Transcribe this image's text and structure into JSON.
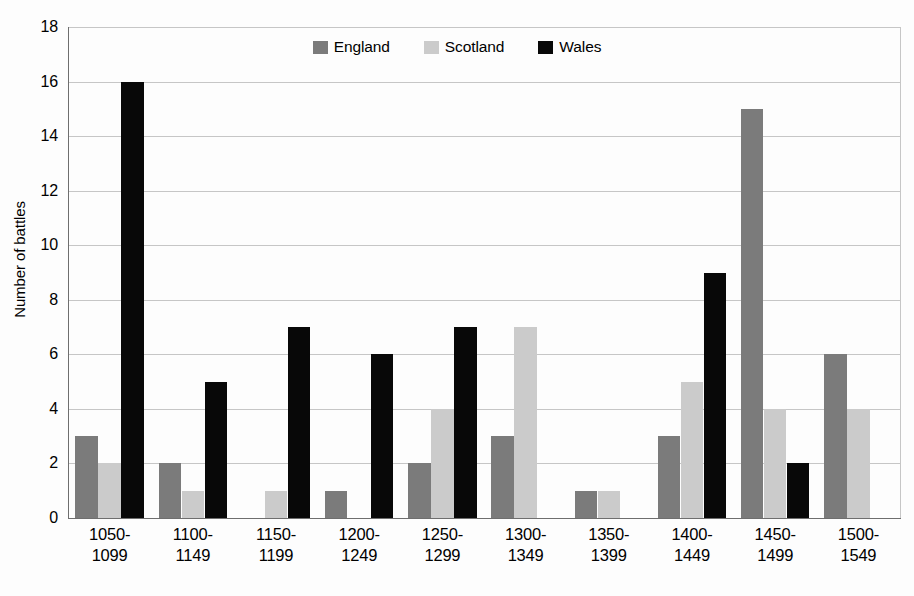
{
  "chart_data": {
    "type": "bar",
    "title": "",
    "xlabel": "",
    "ylabel": "Number of battles",
    "ylim": [
      0,
      18
    ],
    "ytick_step": 2,
    "yticks": [
      "18",
      "16",
      "14",
      "12",
      "10",
      "8",
      "6",
      "4",
      "2",
      "0"
    ],
    "grid": true,
    "legend_position": "top-center",
    "categories": [
      "1050-1099",
      "1100-1149",
      "1150-1199",
      "1200-1249",
      "1250-1299",
      "1300-1349",
      "1350-1399",
      "1400-1449",
      "1450-1499",
      "1500-1549"
    ],
    "category_lines": [
      {
        "line1": "1050-",
        "line2": "1099"
      },
      {
        "line1": "1100-",
        "line2": "1149"
      },
      {
        "line1": "1150-",
        "line2": "1199"
      },
      {
        "line1": "1200-",
        "line2": "1249"
      },
      {
        "line1": "1250-",
        "line2": "1299"
      },
      {
        "line1": "1300-",
        "line2": "1349"
      },
      {
        "line1": "1350-",
        "line2": "1399"
      },
      {
        "line1": "1400-",
        "line2": "1449"
      },
      {
        "line1": "1450-",
        "line2": "1499"
      },
      {
        "line1": "1500-",
        "line2": "1549"
      }
    ],
    "series": [
      {
        "name": "England",
        "color": "#7b7b7b",
        "values": [
          3,
          2,
          0,
          1,
          2,
          3,
          1,
          3,
          15,
          6
        ]
      },
      {
        "name": "Scotland",
        "color": "#cbcbcb",
        "values": [
          2,
          1,
          1,
          0,
          4,
          7,
          1,
          5,
          4,
          4
        ]
      },
      {
        "name": "Wales",
        "color": "#080808",
        "values": [
          16,
          5,
          7,
          6,
          7,
          0,
          0,
          9,
          2,
          0
        ]
      }
    ]
  },
  "legend": {
    "entries": [
      {
        "label": "England",
        "color": "#7b7b7b"
      },
      {
        "label": "Scotland",
        "color": "#cbcbcb"
      },
      {
        "label": "Wales",
        "color": "#080808"
      }
    ]
  }
}
